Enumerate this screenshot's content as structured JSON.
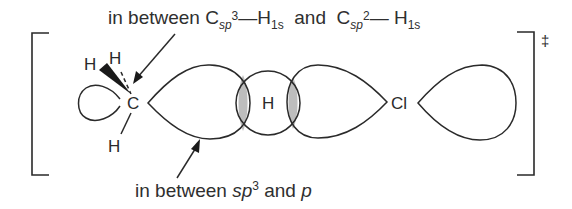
{
  "diagram": {
    "type": "orbital-transition-state",
    "top_label": {
      "prefix": "in  between C",
      "sub1": "sp",
      "sup1": "3",
      "dash1": "—H",
      "sub2": "1s",
      "mid": "  and  C",
      "sub3": "sp",
      "sup3": "2",
      "dash2": "— H",
      "sub4": "1s"
    },
    "bottom_label": {
      "prefix": "in between ",
      "sp": "sp",
      "sup": "3",
      "mid": " and ",
      "p": "p"
    },
    "atoms": {
      "carbon": "C",
      "hydrogen_top_left": "H",
      "hydrogen_top": "H",
      "hydrogen_bottom": "H",
      "hydrogen_center": "H",
      "chlorine": "Cl"
    },
    "transition_state_symbol": "‡",
    "colors": {
      "line": "#2a2a2a",
      "overlap_fill": "#bdbdbd"
    }
  }
}
